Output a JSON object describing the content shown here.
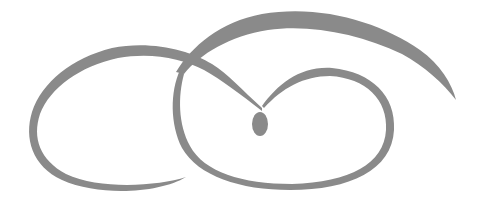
{
  "graphic": {
    "description": "decorative swirl flourish",
    "stroke_color": "#8a8a8a",
    "background": "#ffffff"
  }
}
